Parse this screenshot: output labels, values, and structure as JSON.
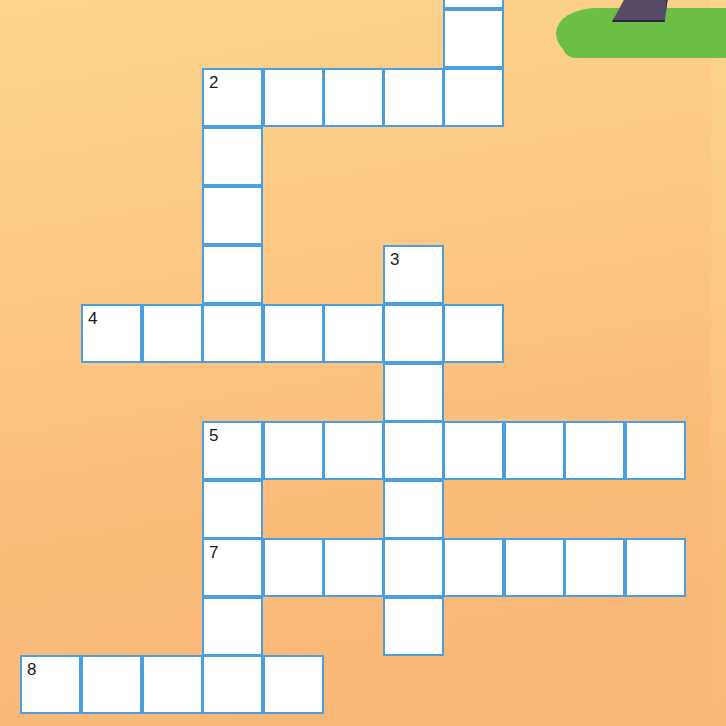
{
  "puzzle": {
    "type": "crossword",
    "colors": {
      "cell_border": "#4a9fe0",
      "cell_fill": "#ffffff",
      "background_top": "#fdd58e",
      "background_bottom": "#f9b676",
      "grass": "#6cbf45",
      "trunk": "#574a66"
    },
    "numbers": {
      "n2": "2",
      "n3": "3",
      "n4": "4",
      "n5": "5",
      "n7": "7",
      "n8": "8"
    },
    "words": [
      {
        "id": "1-down-partial",
        "orientation": "down",
        "cells": [
          [
            7,
            -1
          ],
          [
            7,
            0
          ],
          [
            7,
            1
          ]
        ]
      },
      {
        "id": "2-across",
        "number": "2",
        "orientation": "across",
        "length": 5
      },
      {
        "id": "2-down",
        "number": "2",
        "orientation": "down",
        "length": 5
      },
      {
        "id": "3-down",
        "number": "3",
        "orientation": "down",
        "length": 7
      },
      {
        "id": "4-across",
        "number": "4",
        "orientation": "across",
        "length": 7
      },
      {
        "id": "5-across",
        "number": "5",
        "orientation": "across",
        "length": 8
      },
      {
        "id": "5-down",
        "number": "5",
        "orientation": "down",
        "length": 5
      },
      {
        "id": "7-across",
        "number": "7",
        "orientation": "across",
        "length": 8
      },
      {
        "id": "8-across",
        "number": "8",
        "orientation": "across",
        "length": 5
      }
    ]
  }
}
